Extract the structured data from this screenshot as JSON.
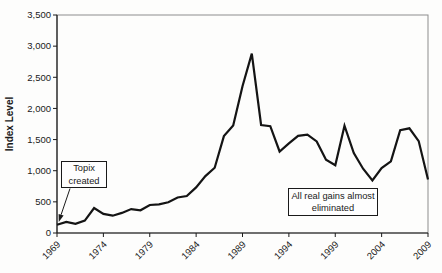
{
  "chart_data": {
    "type": "line",
    "title": "",
    "xlabel": "",
    "ylabel": "Index Level",
    "xlim": [
      1969,
      2009
    ],
    "ylim": [
      0,
      3500
    ],
    "grid": "off",
    "legend": "off",
    "line_color": "#141414",
    "x": [
      1969,
      1970,
      1971,
      1972,
      1973,
      1974,
      1975,
      1976,
      1977,
      1978,
      1979,
      1980,
      1981,
      1982,
      1983,
      1984,
      1985,
      1986,
      1987,
      1988,
      1989,
      1990,
      1991,
      1992,
      1993,
      1994,
      1995,
      1996,
      1997,
      1998,
      1999,
      2000,
      2001,
      2002,
      2003,
      2004,
      2005,
      2006,
      2007,
      2008,
      2009
    ],
    "values": [
      131,
      179,
      148,
      199,
      402,
      306,
      278,
      323,
      384,
      364,
      450,
      460,
      494,
      570,
      594,
      732,
      913,
      1049,
      1556,
      1726,
      2357,
      2881,
      1734,
      1715,
      1308,
      1439,
      1559,
      1578,
      1471,
      1175,
      1087,
      1722,
      1284,
      1032,
      843,
      1044,
      1150,
      1650,
      1681,
      1476,
      859
    ],
    "xtick_values": [
      1969,
      1974,
      1979,
      1984,
      1989,
      1994,
      1999,
      2004,
      2009
    ],
    "xtick_labels": [
      "1969",
      "1974",
      "1979",
      "1984",
      "1989",
      "1994",
      "1999",
      "2004",
      "2009"
    ],
    "ytick_values": [
      0,
      500,
      1000,
      1500,
      2000,
      2500,
      3000,
      3500
    ],
    "ytick_labels": [
      "0",
      "500",
      "1,000",
      "1,500",
      "2,000",
      "2,500",
      "3,000",
      "3,500"
    ],
    "annotations": [
      {
        "text": "Topix created",
        "arrow": true,
        "target": {
          "x": 1969,
          "y": 131
        }
      },
      {
        "text": "All real gains almost eliminated",
        "arrow": false
      }
    ]
  },
  "annotations": {
    "topix": {
      "line1": "Topix",
      "line2": "created"
    },
    "gains": {
      "line1": "All real gains almost",
      "line2": "eliminated"
    }
  }
}
